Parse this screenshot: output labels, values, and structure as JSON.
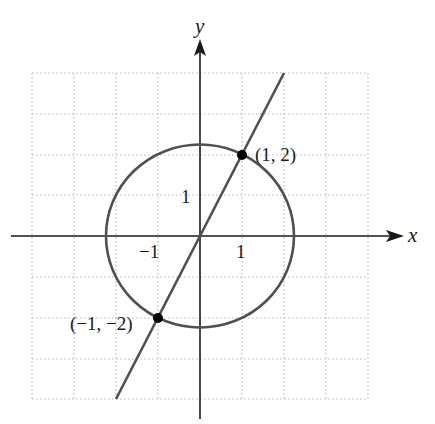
{
  "figure": {
    "axes": {
      "x_label": "x",
      "y_label": "y",
      "x_range": [
        -4,
        4
      ],
      "y_range": [
        -4,
        4
      ]
    },
    "tick_labels": {
      "x_neg_one": "−1",
      "x_one": "1",
      "y_one": "1"
    },
    "points": [
      {
        "label": "(1, 2)",
        "x": 1,
        "y": 2
      },
      {
        "label": "(−1, −2)",
        "x": -1,
        "y": -2
      }
    ],
    "curves": {
      "circle": {
        "equation": "x^2 + y^2 = 5",
        "center": [
          0,
          0
        ],
        "radius": 2.236
      },
      "line": {
        "equation": "y = 2x",
        "slope": 2,
        "from": [
          -2,
          -4
        ],
        "to": [
          2,
          4
        ]
      }
    },
    "colors": {
      "axis": "#1a1a1a",
      "curve": "#505050",
      "grid": "#b8b8b8",
      "point": "#000000"
    }
  }
}
